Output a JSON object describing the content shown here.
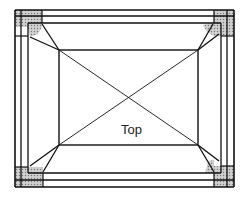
{
  "diagram": {
    "type": "plan-view",
    "label": "Top",
    "colors": {
      "line": "#111111",
      "shade": "#bdbdbd",
      "background": "#ffffff"
    },
    "outer_frame": {
      "left": 15,
      "top": 10,
      "right": 234,
      "bottom": 187
    },
    "frame_offsets": [
      0,
      6,
      13
    ],
    "inner_rect": {
      "left": 59,
      "top": 50,
      "right": 198,
      "bottom": 145
    },
    "label_position": {
      "x": 133,
      "y": 133
    }
  }
}
